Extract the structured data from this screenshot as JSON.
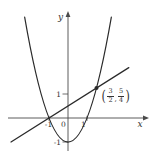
{
  "figure": {
    "background": "#ffffff",
    "axis_color": "#4a4a4a",
    "curve_color": "#2a2a2a",
    "text_color": "#333333",
    "labels": {
      "x_axis": "x",
      "y_axis": "y",
      "origin": "0"
    },
    "point_label": {
      "open": "(",
      "f1_num": "3",
      "f1_den": "2",
      "comma": ",",
      "f2_num": "5",
      "f2_den": "4",
      "close": ")"
    }
  },
  "chart_data": {
    "type": "line",
    "title": "",
    "axes": {
      "xlabel": "x",
      "ylabel": "y",
      "x_ticks": [
        -1,
        1
      ],
      "y_ticks": [
        1,
        -1
      ],
      "origin_label": "0",
      "xlim": [
        -3.2,
        4.3
      ],
      "ylim": [
        -1.55,
        4.35
      ],
      "grid": false
    },
    "series": [
      {
        "name": "parabola",
        "equation": "y = x^2 - 1",
        "curve_type": "quadratic",
        "coeffs": {
          "a": 1,
          "b": 0,
          "c": -1
        },
        "x_domain": [
          -2.28,
          2.28
        ],
        "vertex": [
          0,
          -1
        ],
        "x_intercepts": [
          -1,
          1
        ]
      },
      {
        "name": "secant-line",
        "equation": "y = (x + 1)/2",
        "curve_type": "linear",
        "slope": 0.5,
        "intercept": 0.5,
        "x_domain": [
          -3.0,
          3.2
        ],
        "x_intercept": -1
      }
    ],
    "intersections": [
      [
        -1,
        0
      ],
      [
        1.5,
        1.25
      ]
    ],
    "marked_point": {
      "x": 1.5,
      "y": 1.25,
      "label": "(3/2, 5/4)"
    },
    "plot_transform": {
      "origin_px": [
        68,
        118
      ],
      "x_unit_px": 19,
      "y_unit_px": 24
    },
    "axis_px": {
      "x_start": 8,
      "x_end": 145,
      "y_top": 15,
      "y_bottom": 151
    }
  }
}
